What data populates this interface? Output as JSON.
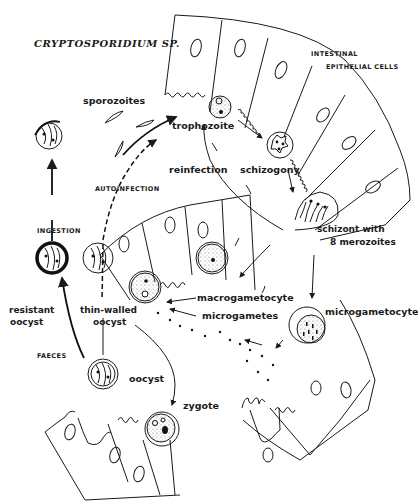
{
  "diagram": {
    "title": "CRYPTOSPORIDIUM SP.",
    "tissue_label_line1": "INTESTINAL",
    "tissue_label_line2": "EPITHELIAL CELLS",
    "stages": {
      "sporozoites": "sporozoites",
      "trophozoite": "trophozoite",
      "reinfection": "reinfection",
      "schizogony": "schizogony",
      "schizont_line1": "schizont with",
      "schizont_line2": "8 merozoites",
      "macrogametocyte": "macrogametocyte",
      "microgametes": "microgametes",
      "microgametocyte": "microgametocyte",
      "zygote": "zygote",
      "oocyst": "oocyst",
      "thin_walled_line1": "thin-walled",
      "thin_walled_line2": "oocyst",
      "resistant_line1": "resistant",
      "resistant_line2": "oocyst"
    },
    "pathway_labels": {
      "autoinfection": "AUTOINFECTION",
      "ingestion": "INGESTION",
      "faeces": "FAECES"
    },
    "colors": {
      "ink": "#1a1a1a",
      "background": "#ffffff"
    }
  }
}
